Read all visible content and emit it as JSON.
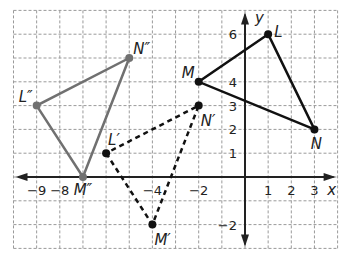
{
  "chart_data": {
    "type": "scatter",
    "title": "",
    "xlabel": "x",
    "ylabel": "y",
    "xlim": [
      -10,
      4
    ],
    "ylim": [
      -3,
      7
    ],
    "grid": true,
    "x_tick_labels": [
      "-9",
      "-8",
      "-4",
      "-2",
      "1",
      "2",
      "3"
    ],
    "y_tick_labels": [
      "6",
      "4",
      "3",
      "2",
      "1",
      "-2"
    ],
    "series": [
      {
        "name": "triangle LMN",
        "style": "solid",
        "color": "#111111",
        "points": [
          {
            "label": "L",
            "x": 1,
            "y": 6
          },
          {
            "label": "M",
            "x": -2,
            "y": 4
          },
          {
            "label": "N",
            "x": 3,
            "y": 2
          }
        ]
      },
      {
        "name": "triangle L'M'N'",
        "style": "dashed",
        "color": "#111111",
        "points": [
          {
            "label": "L'",
            "x": -6,
            "y": 1
          },
          {
            "label": "M'",
            "x": -4,
            "y": -2
          },
          {
            "label": "N'",
            "x": -2,
            "y": 3
          }
        ]
      },
      {
        "name": "triangle L''M''N''",
        "style": "solid",
        "color": "#707070",
        "points": [
          {
            "label": "L''",
            "x": -9,
            "y": 3
          },
          {
            "label": "M''",
            "x": -7,
            "y": 0
          },
          {
            "label": "N''",
            "x": -5,
            "y": 5
          }
        ]
      }
    ]
  },
  "axes": {
    "x_label": "x",
    "y_label": "y"
  },
  "ticks": {
    "x": [
      {
        "v": -9,
        "t": "−9"
      },
      {
        "v": -8,
        "t": "−8"
      },
      {
        "v": -4,
        "t": "−4"
      },
      {
        "v": -2,
        "t": "−2"
      },
      {
        "v": 1,
        "t": "1"
      },
      {
        "v": 2,
        "t": "2"
      },
      {
        "v": 3,
        "t": "3"
      }
    ],
    "y": [
      {
        "v": 6,
        "t": "6"
      },
      {
        "v": 4,
        "t": "4"
      },
      {
        "v": 3,
        "t": "3"
      },
      {
        "v": 2,
        "t": "2"
      },
      {
        "v": 1,
        "t": "1"
      },
      {
        "v": -2,
        "t": "−2"
      }
    ]
  },
  "labels": {
    "L": "L",
    "M": "M",
    "N": "N",
    "L1": "L′",
    "M1": "M′",
    "N1": "N′",
    "L2": "L″",
    "M2": "M″",
    "N2": "N″"
  }
}
